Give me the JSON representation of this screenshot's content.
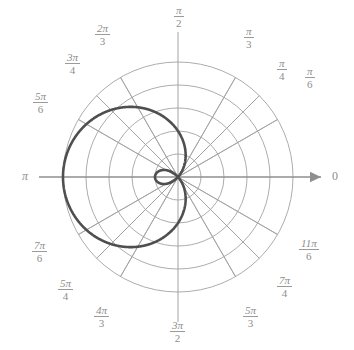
{
  "figure": {
    "kind": "polar-plot",
    "curve_name": "limacon-with-inner-loop",
    "stroke_color": "#4f4f4f",
    "grid_color": "#a3a3a3",
    "label_color": "#8e8e8e",
    "background": "#ffffff"
  },
  "axis_labels": {
    "zero": "0",
    "pi": "π"
  },
  "angle_labels": [
    {
      "id": "pi-over-6",
      "num": "π",
      "den": "6",
      "deg": 30,
      "x": 305,
      "y": 66
    },
    {
      "id": "pi-over-4",
      "num": "π",
      "den": "4",
      "deg": 45,
      "x": 277,
      "y": 58
    },
    {
      "id": "pi-over-3",
      "num": "π",
      "den": "3",
      "deg": 60,
      "x": 244,
      "y": 26
    },
    {
      "id": "pi-over-2",
      "num": "π",
      "den": "2",
      "deg": 90,
      "x": 174,
      "y": 5
    },
    {
      "id": "2pi-over-3",
      "num": "2π",
      "den": "3",
      "deg": 120,
      "x": 95,
      "y": 23
    },
    {
      "id": "3pi-over-4",
      "num": "3π",
      "den": "4",
      "deg": 135,
      "x": 65,
      "y": 52
    },
    {
      "id": "5pi-over-6",
      "num": "5π",
      "den": "6",
      "deg": 150,
      "x": 33,
      "y": 91
    },
    {
      "id": "7pi-over-6",
      "num": "7π",
      "den": "6",
      "deg": 210,
      "x": 32,
      "y": 240
    },
    {
      "id": "5pi-over-4",
      "num": "5π",
      "den": "4",
      "deg": 225,
      "x": 58,
      "y": 278
    },
    {
      "id": "4pi-over-3",
      "num": "4π",
      "den": "3",
      "deg": 240,
      "x": 94,
      "y": 305
    },
    {
      "id": "3pi-over-2",
      "num": "3π",
      "den": "2",
      "deg": 270,
      "x": 170,
      "y": 320
    },
    {
      "id": "5pi-over-3",
      "num": "5π",
      "den": "3",
      "deg": 300,
      "x": 243,
      "y": 305
    },
    {
      "id": "7pi-over-4",
      "num": "7π",
      "den": "4",
      "deg": 315,
      "x": 277,
      "y": 275
    },
    {
      "id": "11pi-over-6",
      "num": "11π",
      "den": "6",
      "deg": 330,
      "x": 299,
      "y": 238
    }
  ],
  "chart_data": {
    "type": "line",
    "coordinate_system": "polar",
    "title": "",
    "xlabel": "",
    "ylabel": "",
    "equation": "r = 2 - 3 cos(θ)",
    "theta_range_rad": [
      0,
      6.283185307179586
    ],
    "r_max_plotted": 5,
    "grid": {
      "radial_circles": [
        1,
        2,
        3,
        4,
        5
      ],
      "radial_spacing_units": 1,
      "angle_spokes_deg": [
        0,
        30,
        45,
        60,
        90,
        120,
        135,
        150,
        180,
        210,
        225,
        240,
        270,
        300,
        315,
        330
      ],
      "axis_line_deg": [
        0,
        90,
        180,
        270
      ],
      "arrow_on_polar_axis": true
    },
    "center_px": {
      "x": 178,
      "y": 177
    },
    "pixels_per_unit": 23,
    "legend": "none",
    "annotations": [
      {
        "text": "0",
        "at_deg": 0
      },
      {
        "text": "π",
        "at_deg": 180
      }
    ],
    "sample_points": [
      {
        "theta_deg": 0,
        "r": -1
      },
      {
        "theta_deg": 30,
        "r": -0.598
      },
      {
        "theta_deg": 45,
        "r": -0.121
      },
      {
        "theta_deg": 60,
        "r": 0.5
      },
      {
        "theta_deg": 90,
        "r": 2
      },
      {
        "theta_deg": 120,
        "r": 3.5
      },
      {
        "theta_deg": 135,
        "r": 4.121
      },
      {
        "theta_deg": 150,
        "r": 4.598
      },
      {
        "theta_deg": 180,
        "r": 5
      },
      {
        "theta_deg": 210,
        "r": 4.598
      },
      {
        "theta_deg": 225,
        "r": 4.121
      },
      {
        "theta_deg": 240,
        "r": 3.5
      },
      {
        "theta_deg": 270,
        "r": 2
      },
      {
        "theta_deg": 300,
        "r": 0.5
      },
      {
        "theta_deg": 315,
        "r": -0.121
      },
      {
        "theta_deg": 330,
        "r": -0.598
      },
      {
        "theta_deg": 360,
        "r": -1
      }
    ]
  }
}
